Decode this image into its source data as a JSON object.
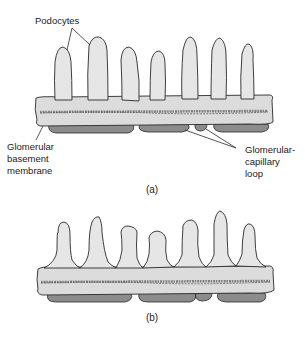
{
  "figure": {
    "panels": [
      {
        "id": "a",
        "caption": "(a)",
        "labels": {
          "podocytes": "Podocytes",
          "gbm": [
            "Glomerular",
            "basement",
            "membrane"
          ],
          "capillary": [
            "Glomerular-",
            "capillary",
            "loop"
          ]
        }
      },
      {
        "id": "b",
        "caption": "(b)"
      }
    ],
    "colors": {
      "podocyte_fill": "#e6e6e6",
      "membrane_fill": "#dcdcdc",
      "capillary_fill": "#8c8c8c",
      "outline": "#2a2a2a",
      "texture": "#6e6e6e"
    }
  }
}
